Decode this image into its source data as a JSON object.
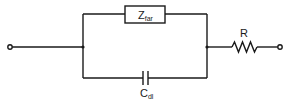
{
  "diagram": {
    "type": "circuit",
    "components": {
      "faradaic_impedance": {
        "label": "Z",
        "subscript": "far"
      },
      "double_layer_capacitor": {
        "label": "C",
        "subscript": "dl"
      },
      "resistor": {
        "label": "R"
      }
    },
    "terminals": [
      "left-input",
      "right-output"
    ],
    "topology": "(Z_far || C_dl) in series with R"
  },
  "colors": {
    "line": "#1a1a1a",
    "background": "#ffffff"
  }
}
